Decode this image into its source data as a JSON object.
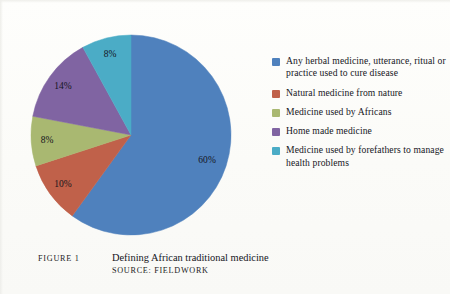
{
  "figure": {
    "number_label": "Figure 1",
    "title": "Defining African traditional medicine",
    "source": "Source: Fieldwork"
  },
  "chart_data": {
    "type": "pie",
    "title": "Defining African traditional medicine",
    "xlabel": "",
    "ylabel": "",
    "grid": false,
    "legend_position": "right",
    "start_angle_deg": 0,
    "direction": "clockwise",
    "categories": [
      "Any herbal medicine, utterance, ritual or practice used to cure disease",
      "Natural medicine from nature",
      "Medicine used by Africans",
      "Home made medicine",
      "Medicine used by forefathers to manage health problems"
    ],
    "values": [
      60,
      10,
      8,
      14,
      8
    ],
    "value_labels": [
      "60%",
      "10%",
      "8%",
      "14%",
      "8%"
    ],
    "colors": [
      "#4F81BD",
      "#C0614A",
      "#A9B871",
      "#8064A2",
      "#4BACC6"
    ]
  },
  "legend": {
    "items": [
      {
        "label": "Any herbal medicine, utterance, ritual or practice used to cure disease",
        "color": "#4F81BD"
      },
      {
        "label": "Natural medicine from nature",
        "color": "#C0614A"
      },
      {
        "label": "Medicine used by Africans",
        "color": "#A9B871"
      },
      {
        "label": "Home made medicine",
        "color": "#8064A2"
      },
      {
        "label": "Medicine used by forefathers to manage health problems",
        "color": "#4BACC6"
      }
    ]
  }
}
